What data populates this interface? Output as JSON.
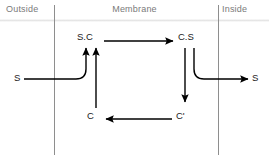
{
  "canvas": {
    "width": 269,
    "height": 157,
    "background": "#ffffff"
  },
  "header": {
    "outside_label": "Outside",
    "membrane_label": "Membrane",
    "inside_label": "Inside",
    "label_color": "#7a7a7a",
    "rule_color": "#e3e3e3"
  },
  "boundaries": {
    "left_x": 54,
    "right_x": 218,
    "color": "#8e8e8e"
  },
  "nodes": [
    {
      "id": "s-outside",
      "label": "S",
      "x": 14,
      "y": 72,
      "region": "outside"
    },
    {
      "id": "sc-complex",
      "label": "S.C",
      "x": 77,
      "y": 31,
      "region": "membrane"
    },
    {
      "id": "cs-complex",
      "label": "C.S",
      "x": 178,
      "y": 31,
      "region": "membrane"
    },
    {
      "id": "c-carrier",
      "label": "C",
      "x": 87,
      "y": 110,
      "region": "membrane"
    },
    {
      "id": "c-prime",
      "label": "C'",
      "x": 176,
      "y": 110,
      "region": "membrane"
    },
    {
      "id": "s-inside",
      "label": "S",
      "x": 252,
      "y": 72,
      "region": "inside"
    }
  ],
  "arrows": [
    {
      "id": "sc-to-cs",
      "from": "S.C",
      "to": "C.S",
      "direction": "right",
      "style": "straight"
    },
    {
      "id": "cs-to-cprime",
      "from": "C.S",
      "to": "C'",
      "direction": "down",
      "style": "straight"
    },
    {
      "id": "cprime-to-c",
      "from": "C'",
      "to": "C",
      "direction": "left",
      "style": "straight"
    },
    {
      "id": "c-to-sc",
      "from": "C",
      "to": "S.C",
      "direction": "up",
      "style": "straight"
    },
    {
      "id": "s-out-to-sc",
      "from": "S",
      "to": "S.C",
      "direction": "up",
      "style": "curved"
    },
    {
      "id": "cs-to-s-in",
      "from": "C.S",
      "to": "S",
      "direction": "right",
      "style": "curved"
    }
  ],
  "stroke": {
    "color": "#000000",
    "width": 1.4
  }
}
